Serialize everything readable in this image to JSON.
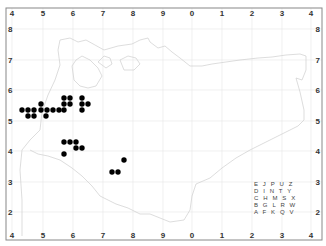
{
  "map": {
    "frame": {
      "left": 6,
      "top": 8,
      "right": 322,
      "bottom": 240,
      "color": "#888888"
    },
    "grid_color": "#e6e6e6",
    "coast_color": "#cfcfcf",
    "dot_color": "#000000",
    "x_ticks": [
      {
        "label": "4",
        "x": 12
      },
      {
        "label": "5",
        "x": 43
      },
      {
        "label": "6",
        "x": 73
      },
      {
        "label": "7",
        "x": 103
      },
      {
        "label": "8",
        "x": 133
      },
      {
        "label": "9",
        "x": 163
      },
      {
        "label": "0",
        "x": 192
      },
      {
        "label": "1",
        "x": 222
      },
      {
        "label": "2",
        "x": 252
      },
      {
        "label": "3",
        "x": 282
      },
      {
        "label": "4",
        "x": 311
      }
    ],
    "y_ticks": [
      {
        "label": "8",
        "y": 29
      },
      {
        "label": "7",
        "y": 60
      },
      {
        "label": "6",
        "y": 90
      },
      {
        "label": "5",
        "y": 121
      },
      {
        "label": "4",
        "y": 151
      },
      {
        "label": "3",
        "y": 182
      },
      {
        "label": "2",
        "y": 212
      }
    ],
    "dots": [
      {
        "x": 64,
        "y": 98
      },
      {
        "x": 70,
        "y": 98
      },
      {
        "x": 82,
        "y": 98
      },
      {
        "x": 41,
        "y": 104
      },
      {
        "x": 64,
        "y": 104
      },
      {
        "x": 70,
        "y": 104
      },
      {
        "x": 82,
        "y": 104
      },
      {
        "x": 88,
        "y": 104
      },
      {
        "x": 22,
        "y": 110
      },
      {
        "x": 28,
        "y": 110
      },
      {
        "x": 34,
        "y": 110
      },
      {
        "x": 41,
        "y": 110
      },
      {
        "x": 47,
        "y": 110
      },
      {
        "x": 53,
        "y": 110
      },
      {
        "x": 59,
        "y": 110
      },
      {
        "x": 64,
        "y": 110
      },
      {
        "x": 82,
        "y": 110
      },
      {
        "x": 28,
        "y": 116
      },
      {
        "x": 34,
        "y": 116
      },
      {
        "x": 46,
        "y": 116
      },
      {
        "x": 64,
        "y": 142
      },
      {
        "x": 70,
        "y": 142
      },
      {
        "x": 76,
        "y": 142
      },
      {
        "x": 76,
        "y": 148
      },
      {
        "x": 82,
        "y": 148
      },
      {
        "x": 64,
        "y": 154
      },
      {
        "x": 124,
        "y": 160
      },
      {
        "x": 112,
        "y": 172
      },
      {
        "x": 118,
        "y": 172
      }
    ],
    "legend": {
      "rows": [
        "E J P U Z",
        "D I N T Y",
        "C H M S X",
        "B G L R W",
        "A F K Q V"
      ]
    }
  }
}
